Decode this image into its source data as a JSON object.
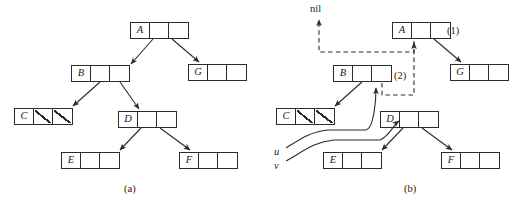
{
  "figure": {
    "panels": [
      {
        "id": "a",
        "caption": "(a)",
        "caption_pos": {
          "x": 124,
          "y": 183
        },
        "nodes": [
          {
            "key": "A",
            "x": 130,
            "y": 22,
            "cells": [
              "key",
              "ptr",
              "ptr"
            ]
          },
          {
            "key": "B",
            "x": 71,
            "y": 65,
            "cells": [
              "key",
              "ptr",
              "ptr"
            ]
          },
          {
            "key": "G",
            "x": 188,
            "y": 64,
            "cells": [
              "key",
              "ptr",
              "ptr"
            ]
          },
          {
            "key": "C",
            "x": 14,
            "y": 108,
            "cells": [
              "key",
              "nil",
              "nil"
            ]
          },
          {
            "key": "D",
            "x": 118,
            "y": 111,
            "cells": [
              "key",
              "ptr",
              "ptr"
            ]
          },
          {
            "key": "E",
            "x": 61,
            "y": 152,
            "cells": [
              "key",
              "ptr",
              "ptr"
            ]
          },
          {
            "key": "F",
            "x": 179,
            "y": 152,
            "cells": [
              "key",
              "ptr",
              "ptr"
            ]
          }
        ],
        "edges": [
          {
            "from": "A.left",
            "to": "B",
            "x1": 153,
            "y1": 39,
            "x2": 131,
            "y2": 64
          },
          {
            "from": "A.right",
            "to": "G",
            "x1": 172,
            "y1": 39,
            "x2": 199,
            "y2": 62
          },
          {
            "from": "B.left",
            "to": "C",
            "x1": 100,
            "y1": 82,
            "x2": 73,
            "y2": 106
          },
          {
            "from": "B.right",
            "to": "D",
            "x1": 120,
            "y1": 82,
            "x2": 139,
            "y2": 109
          },
          {
            "from": "D.left",
            "to": "E",
            "x1": 141,
            "y1": 128,
            "x2": 120,
            "y2": 150
          },
          {
            "from": "D.right",
            "to": "F",
            "x1": 160,
            "y1": 128,
            "x2": 190,
            "y2": 150
          }
        ]
      },
      {
        "id": "b",
        "caption": "(b)",
        "caption_pos": {
          "x": 142,
          "y": 183
        },
        "nodes": [
          {
            "key": "A",
            "x": 130,
            "y": 22,
            "cells": [
              "key",
              "ptr",
              "ptr"
            ]
          },
          {
            "key": "B",
            "x": 71,
            "y": 65,
            "cells": [
              "key",
              "ptr",
              "ptr"
            ]
          },
          {
            "key": "G",
            "x": 188,
            "y": 64,
            "cells": [
              "key",
              "ptr",
              "ptr"
            ]
          },
          {
            "key": "C",
            "x": 14,
            "y": 108,
            "cells": [
              "key",
              "nil",
              "nil"
            ]
          },
          {
            "key": "D",
            "x": 118,
            "y": 111,
            "cells": [
              "key",
              "ptr",
              "ptr"
            ]
          },
          {
            "key": "E",
            "x": 61,
            "y": 152,
            "cells": [
              "key",
              "ptr",
              "ptr"
            ]
          },
          {
            "key": "F",
            "x": 179,
            "y": 152,
            "cells": [
              "key",
              "ptr",
              "ptr"
            ]
          }
        ],
        "edges": [
          {
            "from": "A.right",
            "to": "G",
            "x1": 172,
            "y1": 39,
            "x2": 199,
            "y2": 62
          },
          {
            "from": "B.left",
            "to": "C",
            "x1": 100,
            "y1": 82,
            "x2": 73,
            "y2": 106
          },
          {
            "from": "D.left",
            "to": "E",
            "x1": 141,
            "y1": 128,
            "x2": 120,
            "y2": 150
          },
          {
            "from": "D.right",
            "to": "F",
            "x1": 160,
            "y1": 128,
            "x2": 190,
            "y2": 150
          }
        ],
        "dashed_edges": [
          {
            "name": "a-left-to-nil",
            "label": "nil"
          },
          {
            "name": "b-right-to-a-left",
            "label": "(2)"
          }
        ],
        "annotations": [
          {
            "text": "nil",
            "x": 54,
            "y": 4,
            "style": "upright"
          },
          {
            "text": "(1)",
            "x": 185,
            "y": 26,
            "style": "upright"
          },
          {
            "text": "(2)",
            "x": 132,
            "y": 71,
            "style": "upright"
          },
          {
            "text": "u",
            "x": 12,
            "y": 151,
            "style": "italic"
          },
          {
            "text": "v",
            "x": 12,
            "y": 164,
            "style": "italic"
          }
        ],
        "pointer_vars": [
          {
            "name": "u",
            "targets": "B.left-pointer-cell"
          },
          {
            "name": "v",
            "targets": "D.key-cell"
          }
        ]
      }
    ],
    "colors": {
      "stroke": "#2b2b2b",
      "background": "#ffffff",
      "dashed_stroke": "#3a3a3a"
    }
  }
}
